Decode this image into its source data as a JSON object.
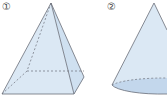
{
  "figures": [
    {
      "label": "①",
      "shape": "square-pyramid"
    },
    {
      "label": "②",
      "shape": "cone"
    }
  ],
  "colors": {
    "fill_light": "#dde9f5",
    "fill_mid": "#c9dcee",
    "fill_base": "#b9d0e8",
    "stroke": "#6b6f78"
  }
}
